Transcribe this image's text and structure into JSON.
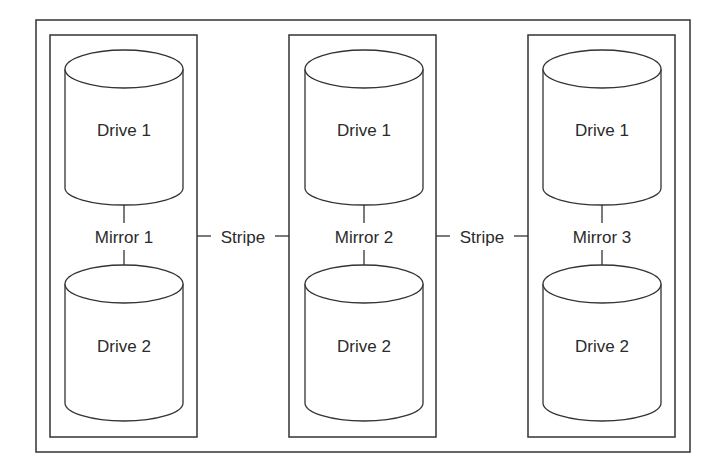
{
  "diagram": {
    "mirrors": [
      {
        "label": "Mirror 1",
        "drives": [
          {
            "label": "Drive 1"
          },
          {
            "label": "Drive 2"
          }
        ]
      },
      {
        "label": "Mirror 2",
        "drives": [
          {
            "label": "Drive 1"
          },
          {
            "label": "Drive 2"
          }
        ]
      },
      {
        "label": "Mirror 3",
        "drives": [
          {
            "label": "Drive 1"
          },
          {
            "label": "Drive 2"
          }
        ]
      }
    ],
    "connectors": [
      {
        "label": "Stripe"
      },
      {
        "label": "Stripe"
      }
    ],
    "colors": {
      "stroke": "#333333",
      "background": "#ffffff",
      "text": "#2a2a2a"
    }
  }
}
